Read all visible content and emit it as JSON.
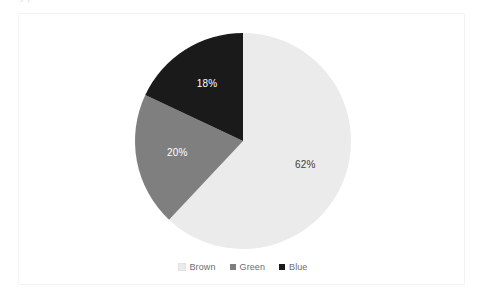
{
  "page": {
    "background_color": "#ffffff",
    "top_caption": "y p"
  },
  "chart_frame": {
    "border_color": "#f3f3f3",
    "background_color": "#ffffff"
  },
  "legend": {
    "position": "bottom-center",
    "items": [
      {
        "label": "Brown",
        "color": "#ebebeb",
        "marker": "square-swatch"
      },
      {
        "label": "Green",
        "color": "#7f7f7f",
        "marker": "square-swatch"
      },
      {
        "label": "Blue",
        "color": "#1a1a1a",
        "marker": "square-swatch"
      }
    ]
  },
  "labels": {
    "brown": "62%",
    "green": "20%",
    "blue": "18%"
  },
  "chart_data": {
    "type": "pie",
    "title": "",
    "subtitle": "",
    "xlabel": "",
    "ylabel": "",
    "categories": [
      "Brown",
      "Green",
      "Blue"
    ],
    "values": [
      62,
      20,
      18
    ],
    "data_labels": [
      "62%",
      "20%",
      "18%"
    ],
    "units": "percent",
    "total": 100,
    "start_angle_deg": 0,
    "direction": "clockwise",
    "colors": [
      "#ebebeb",
      "#7f7f7f",
      "#1a1a1a"
    ],
    "label_text_colors": [
      "#404040",
      "#ffffff",
      "#ffffff"
    ],
    "legend": {
      "show": true,
      "position": "bottom",
      "entries": [
        "Brown",
        "Green",
        "Blue"
      ]
    },
    "grid": false,
    "slices": [
      {
        "name": "Brown",
        "value": 62,
        "label": "62%",
        "color": "#ebebeb",
        "start_deg": 0,
        "end_deg": 223.2
      },
      {
        "name": "Green",
        "value": 20,
        "label": "20%",
        "color": "#7f7f7f",
        "start_deg": 223.2,
        "end_deg": 295.2
      },
      {
        "name": "Blue",
        "value": 18,
        "label": "18%",
        "color": "#1a1a1a",
        "start_deg": 295.2,
        "end_deg": 360
      }
    ]
  }
}
